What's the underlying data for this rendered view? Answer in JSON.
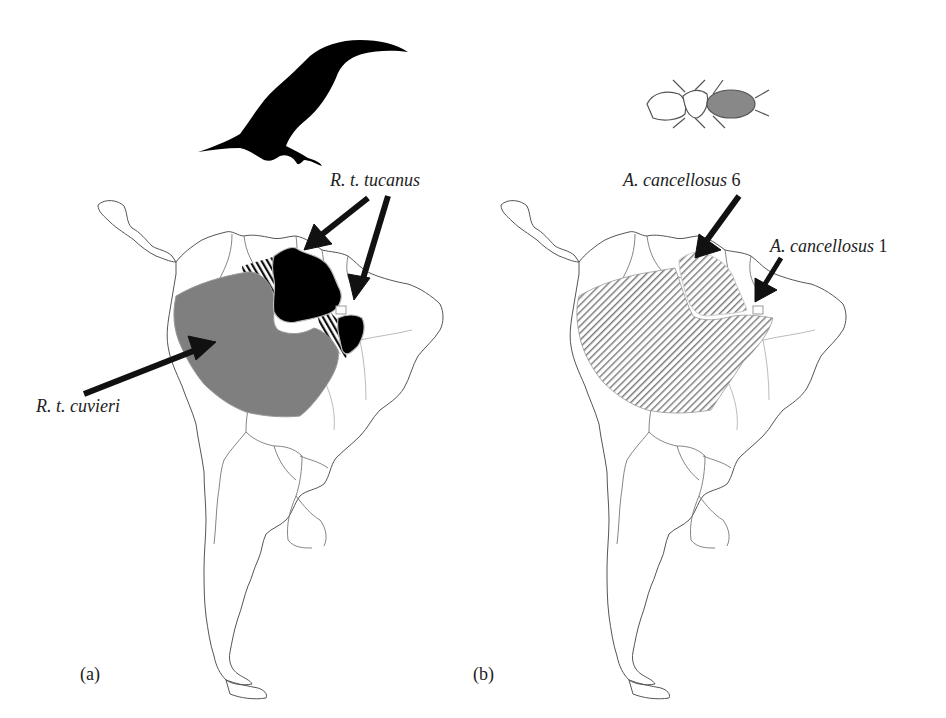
{
  "figure": {
    "panels": [
      {
        "id": "a",
        "letter": "(a)",
        "icon": "toucan-silhouette-icon",
        "labels": {
          "tucanus_italic": "R. t. tucanus",
          "cuvieri_italic": "R. t. cuvieri"
        },
        "regions": [
          {
            "name": "R. t. tucanus",
            "fill": "#000000"
          },
          {
            "name": "R. t. cuvieri",
            "fill": "#7f7f7f"
          },
          {
            "name": "hybrid zone",
            "fill": "hatched"
          }
        ]
      },
      {
        "id": "b",
        "letter": "(b)",
        "icon": "louse-illustration-icon",
        "labels": {
          "lineage6_italic": "A. cancellosus",
          "lineage6_num": " 6",
          "lineage1_italic": "A. cancellosus",
          "lineage1_num": " 1"
        },
        "regions": [
          {
            "name": "A. cancellosus 6",
            "fill": "hatched"
          },
          {
            "name": "A. cancellosus 1",
            "fill": "hatched"
          }
        ]
      }
    ]
  }
}
